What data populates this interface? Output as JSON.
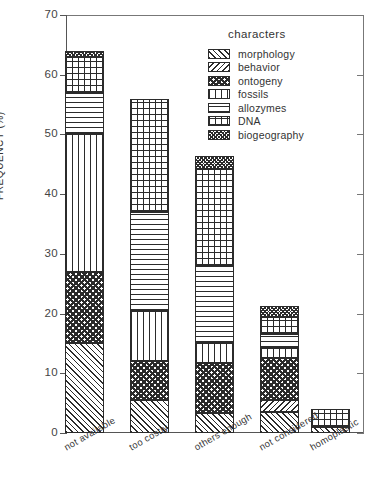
{
  "chart_data": {
    "type": "bar",
    "subtype": "stacked-bar",
    "title": "",
    "xlabel": "",
    "ylabel": "FREQUENCY (%)",
    "ylim": [
      0,
      70
    ],
    "yticks": [
      0,
      10,
      20,
      30,
      40,
      50,
      60,
      70
    ],
    "ytick_labels": [
      "0",
      "10",
      "20",
      "30",
      "40",
      "50",
      "60",
      "70"
    ],
    "grid": false,
    "legend_title": "characters",
    "legend_position": "top-right-inside",
    "categories": [
      "not available",
      "too costly",
      "others enough",
      "not considered",
      "homoplastic"
    ],
    "series": [
      {
        "name": "morphology",
        "values": [
          15.0,
          5.5,
          3.3,
          3.5,
          1.0
        ]
      },
      {
        "name": "behavior",
        "values": [
          0.0,
          0.0,
          0.0,
          2.0,
          0.0
        ]
      },
      {
        "name": "ontogeny",
        "values": [
          12.0,
          6.5,
          8.5,
          7.1,
          0.0
        ]
      },
      {
        "name": "fossils",
        "values": [
          23.0,
          8.5,
          3.2,
          1.6,
          0.0
        ]
      },
      {
        "name": "allozymes",
        "values": [
          7.0,
          16.5,
          13.0,
          2.4,
          0.0
        ]
      },
      {
        "name": "DNA",
        "values": [
          6.0,
          19.0,
          16.2,
          2.9,
          3.0
        ]
      },
      {
        "name": "biogeography",
        "values": [
          1.0,
          0.0,
          2.2,
          1.8,
          0.0
        ]
      }
    ],
    "totals": [
      64.0,
      56.0,
      46.4,
      21.3,
      4.0
    ]
  }
}
